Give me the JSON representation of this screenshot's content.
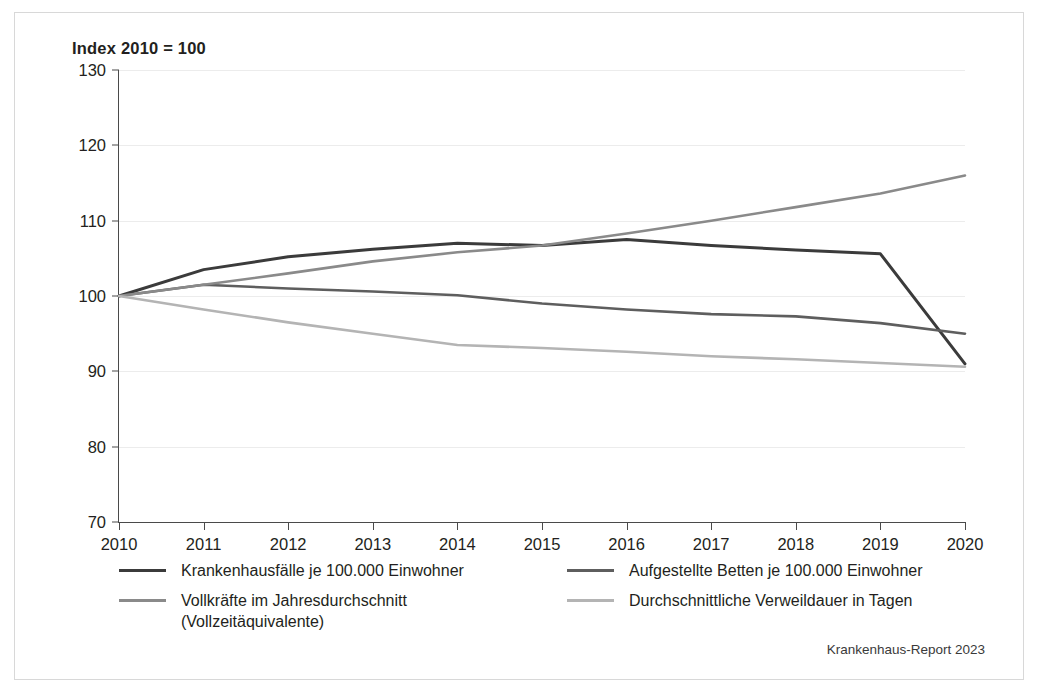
{
  "figure": {
    "title": "Index 2010  = 100",
    "source": "Krankenhaus-Report 2023",
    "frame_color": "#d8d8d8",
    "background": "#ffffff"
  },
  "legend": {
    "items": [
      {
        "label": "Krankenhausfälle je 100.000 Einwohner",
        "color": "#3b3b3b",
        "column": "left",
        "row": 1
      },
      {
        "label": "Aufgestellte Betten je 100.000 Einwohner",
        "color": "#5e5e5e",
        "column": "right",
        "row": 1
      },
      {
        "label": "Vollkräfte im Jahresdurchschnitt\n(Vollzeitäquivalente)",
        "color": "#8a8a8a",
        "column": "left",
        "row": 2
      },
      {
        "label": "Durchschnittliche Verweildauer in Tagen",
        "color": "#b4b4b4",
        "column": "right",
        "row": 2
      }
    ]
  },
  "chart_data": {
    "type": "line",
    "title": "Index 2010  = 100",
    "xlabel": "",
    "ylabel": "Index 2010 = 100",
    "x": [
      2010,
      2011,
      2012,
      2013,
      2014,
      2015,
      2016,
      2017,
      2018,
      2019,
      2020
    ],
    "xticklabels": [
      "2010",
      "2011",
      "2012",
      "2013",
      "2014",
      "2015",
      "2016",
      "2017",
      "2018",
      "2019",
      "2020"
    ],
    "yticks": [
      70,
      80,
      90,
      100,
      110,
      120,
      130
    ],
    "yticklabels": [
      "70",
      "80",
      "90",
      "100",
      "110",
      "120",
      "130"
    ],
    "ylim": [
      70,
      130
    ],
    "xlim": [
      2010,
      2020
    ],
    "grid": true,
    "legend_position": "below",
    "series": [
      {
        "name": "Krankenhausfälle je 100.000 Einwohner",
        "color": "#3b3b3b",
        "width": 3.0,
        "values": [
          100,
          103.5,
          105.2,
          106.2,
          107.0,
          106.7,
          107.5,
          106.7,
          106.1,
          105.6,
          91.0
        ]
      },
      {
        "name": "Aufgestellte Betten je 100.000 Einwohner",
        "color": "#5e5e5e",
        "width": 2.6,
        "values": [
          100,
          101.5,
          101.0,
          100.6,
          100.1,
          99.0,
          98.2,
          97.6,
          97.3,
          96.4,
          95.0
        ]
      },
      {
        "name": "Vollkräfte im Jahresdurchschnitt (Vollzeitäquivalente)",
        "color": "#8a8a8a",
        "width": 2.6,
        "values": [
          100,
          101.5,
          103.0,
          104.6,
          105.8,
          106.7,
          108.3,
          110.0,
          111.8,
          113.6,
          116.0
        ]
      },
      {
        "name": "Durchschnittliche Verweildauer in Tagen",
        "color": "#b4b4b4",
        "width": 2.6,
        "values": [
          100,
          98.2,
          96.5,
          95.0,
          93.5,
          93.1,
          92.6,
          92.0,
          91.6,
          91.1,
          90.6
        ]
      }
    ]
  }
}
